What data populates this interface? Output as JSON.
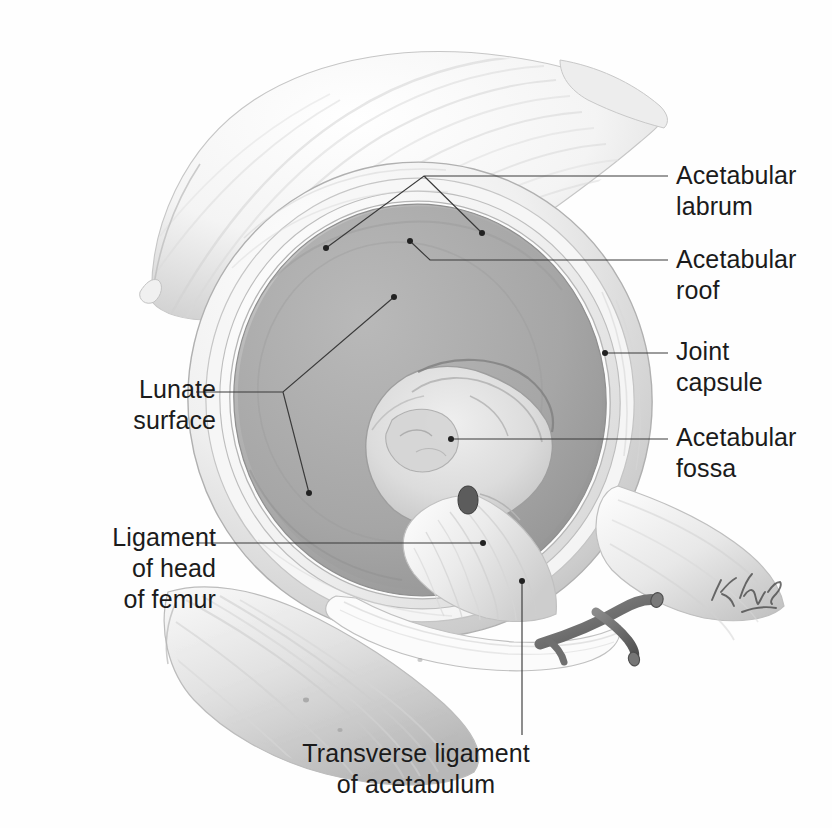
{
  "figure": {
    "modality": "anatomical-illustration",
    "background_color": "#fefefe",
    "ink_color": "#1b1b1b",
    "leader_color": "#3a3a3a",
    "bone_light": "#fbfbfb",
    "bone_mid": "#d8d8d8",
    "bone_shadow": "#9a9a9a",
    "cartilage_fill": "#a8a8a8",
    "fossa_fill": "#c9c9c9",
    "signature": "K. Wesker"
  },
  "labels": {
    "acetabular_labrum": "Acetabular\nlabrum",
    "acetabular_roof": "Acetabular\nroof",
    "joint_capsule": "Joint\ncapsule",
    "acetabular_fossa": "Acetabular\nfossa",
    "lunate_surface": "Lunate\nsurface",
    "ligament_of_head_of_femur": "Ligament\nof head\nof femur",
    "transverse_ligament_of_acetabulum": "Transverse ligament\nof acetabulum"
  },
  "leaders": [
    {
      "name": "acetabular-labrum-leader",
      "label": "Acetabular labrum",
      "branched": true,
      "path": "M 668 176 L 424 176 L 326 248 M 424 176 L 482 233",
      "dots": [
        [
          326,
          248
        ],
        [
          482,
          233
        ]
      ]
    },
    {
      "name": "acetabular-roof-leader",
      "label": "Acetabular roof",
      "branched": false,
      "path": "M 668 260 L 430 260 L 412 243 L 408 240",
      "dots": [
        [
          408,
          240
        ]
      ]
    },
    {
      "name": "joint-capsule-leader",
      "label": "Joint capsule",
      "branched": false,
      "path": "M 668 353 L 605 353",
      "dots": [
        [
          605,
          353
        ]
      ]
    },
    {
      "name": "acetabular-fossa-leader",
      "label": "Acetabular fossa",
      "branched": false,
      "path": "M 668 439 L 451 439",
      "dots": [
        [
          451,
          439
        ]
      ]
    },
    {
      "name": "lunate-surface-leader",
      "label": "Lunate surface",
      "branched": true,
      "path": "M 196 392 L 283 392 L 394 297 M 283 392 L 309 493",
      "dots": [
        [
          394,
          297
        ],
        [
          309,
          493
        ]
      ]
    },
    {
      "name": "ligament-of-head-of-femur-leader",
      "label": "Ligament of head of femur",
      "branched": false,
      "path": "M 196 543 L 483 543",
      "dots": [
        [
          483,
          543
        ]
      ]
    },
    {
      "name": "transverse-ligament-leader",
      "label": "Transverse ligament of acetabulum",
      "branched": false,
      "path": "M 522 735 L 522 581",
      "dots": [
        [
          522,
          581
        ]
      ]
    }
  ],
  "structures": [
    {
      "name": "ilium",
      "region": "upper-left"
    },
    {
      "name": "acetabular-rim",
      "region": "center"
    },
    {
      "name": "lunate-surface",
      "region": "center-ring"
    },
    {
      "name": "acetabular-fossa",
      "region": "center"
    },
    {
      "name": "ligament-of-head-of-femur",
      "region": "center-lower"
    },
    {
      "name": "transverse-acetabular-ligament",
      "region": "lower-center"
    },
    {
      "name": "ischium",
      "region": "lower-left"
    },
    {
      "name": "joint-capsule",
      "region": "right-rim"
    },
    {
      "name": "pubis",
      "region": "right"
    }
  ]
}
